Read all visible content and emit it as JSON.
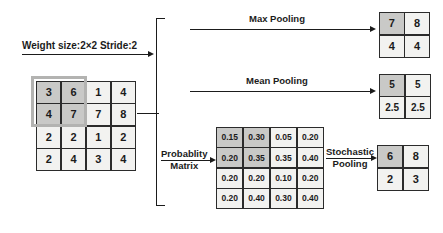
{
  "figure": {
    "weight_label": "Weight size:2×2 Stride:2"
  },
  "input_matrix": {
    "name": "input feature map",
    "rows": 4,
    "cols": 4,
    "values": [
      [
        "3",
        "6",
        "1",
        "4"
      ],
      [
        "4",
        "7",
        "7",
        "8"
      ],
      [
        "2",
        "2",
        "1",
        "2"
      ],
      [
        "2",
        "4",
        "3",
        "4"
      ]
    ],
    "highlighted": [
      [
        0,
        0
      ],
      [
        0,
        1
      ],
      [
        1,
        0
      ],
      [
        1,
        1
      ]
    ]
  },
  "probability_matrix": {
    "label_line1": "Probablity",
    "label_line2": "Matrix",
    "rows": 4,
    "cols": 4,
    "values": [
      [
        "0.15",
        "0.30",
        "0.05",
        "0.20"
      ],
      [
        "0.20",
        "0.35",
        "0.35",
        "0.40"
      ],
      [
        "0.20",
        "0.20",
        "0.10",
        "0.20"
      ],
      [
        "0.20",
        "0.40",
        "0.30",
        "0.40"
      ]
    ],
    "highlighted": [
      [
        0,
        0
      ],
      [
        0,
        1
      ],
      [
        1,
        0
      ],
      [
        1,
        1
      ]
    ]
  },
  "branches": {
    "max": {
      "label": "Max Pooling",
      "output": [
        [
          "7",
          "8"
        ],
        [
          "4",
          "4"
        ]
      ],
      "highlighted": [
        [
          0,
          0
        ]
      ]
    },
    "mean": {
      "label": "Mean Pooling",
      "output": [
        [
          "5",
          "5"
        ],
        [
          "2.5",
          "2.5"
        ]
      ],
      "highlighted": [
        [
          0,
          0
        ]
      ]
    },
    "stochastic": {
      "label_line1": "Stochastic",
      "label_line2": "Pooling",
      "output": [
        [
          "6",
          "8"
        ],
        [
          "2",
          "3"
        ]
      ],
      "highlighted": [
        [
          0,
          0
        ]
      ]
    }
  },
  "colors": {
    "background": "#ffffff",
    "cell_fill": "#f2f2f0",
    "cell_highlight": "#c9c9c7",
    "border": "#2b2b2b",
    "window_border": "#b3b3b1",
    "text": "#1b1b1b"
  }
}
